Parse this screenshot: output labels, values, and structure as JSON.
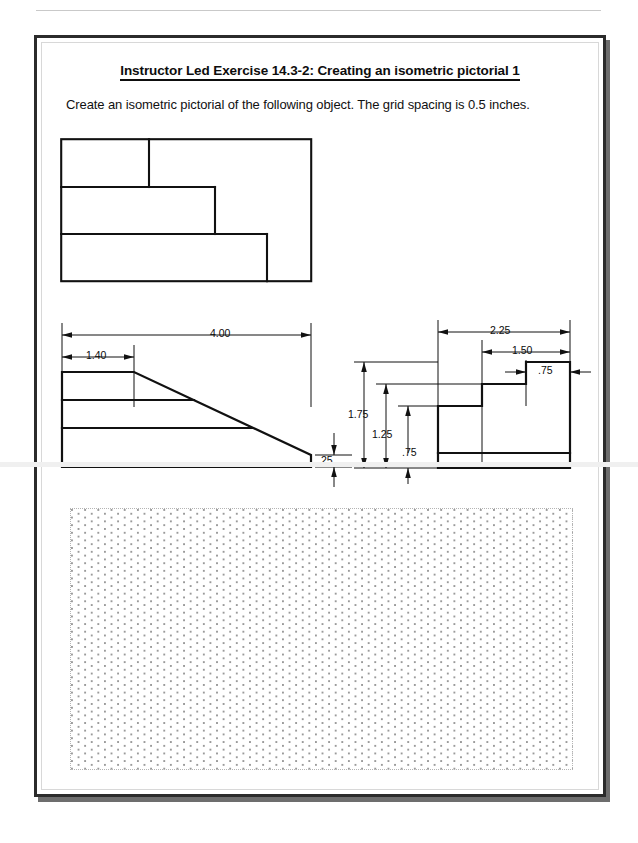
{
  "document": {
    "title": "Instructor Led Exercise 14.3-2:  Creating an isometric pictorial 1",
    "instruction": "Create an isometric pictorial of the following object.  The grid spacing is 0.5 inches."
  },
  "views": {
    "top_view": {
      "name": "top view",
      "description": "Stepped rectangular top view with three offset rectangles"
    },
    "front_view": {
      "name": "front view",
      "description": "Front view with sloped face from 1.40 to full width, 0.25 thick base"
    },
    "side_view": {
      "name": "right side view",
      "description": "Right side view with three descending steps and a base slab"
    }
  },
  "dimensions": {
    "front": {
      "overall_width": "4.00",
      "step_width": "1.40",
      "edge_height": ".25"
    },
    "side": {
      "overall_depth": "2.25",
      "second_step": "1.50",
      "third_step": ".75",
      "overall_height": "1.75",
      "mid_height": "1.25",
      "base_height": ".75"
    }
  },
  "grid": {
    "name": "isometric-dot-grid",
    "spacing_note": "0.5 inches"
  }
}
